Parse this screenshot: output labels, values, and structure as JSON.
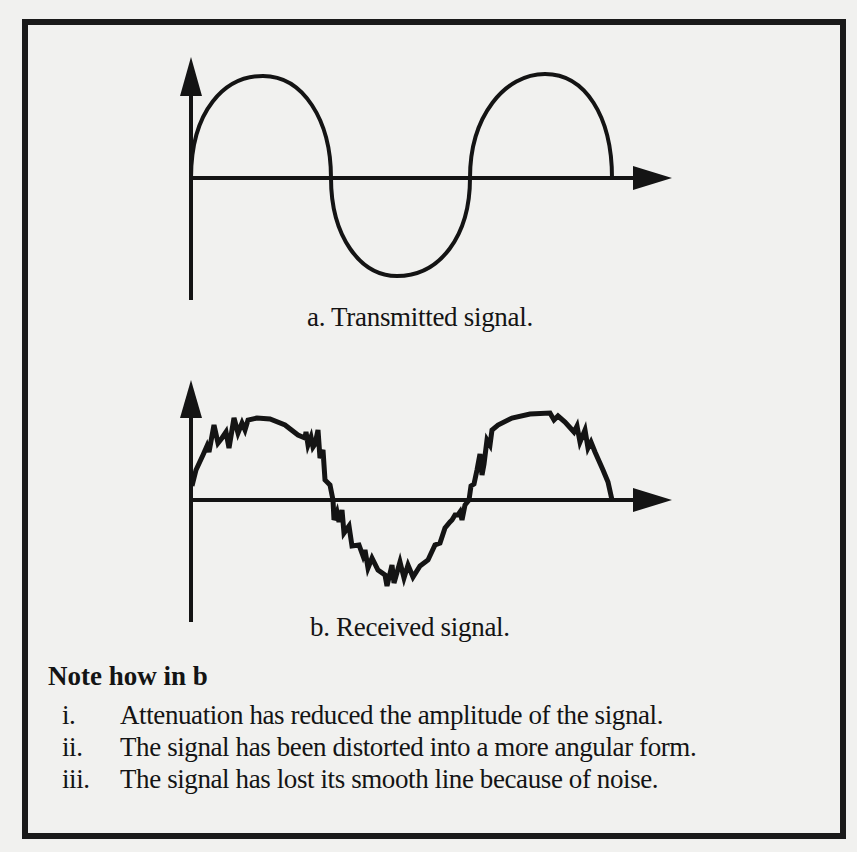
{
  "figure": {
    "caption_a": "a. Transmitted signal.",
    "caption_b": "b. Received signal."
  },
  "note": {
    "title": "Note how  in b",
    "items": [
      {
        "num": "i.",
        "text": "Attenuation has reduced the amplitude of the signal."
      },
      {
        "num": "ii.",
        "text": "The signal has been distorted into a more angular form."
      },
      {
        "num": "iii.",
        "text": "The signal has lost its smooth line because of noise."
      }
    ]
  },
  "colors": {
    "ink": "#141414",
    "paper": "#f1f1ef"
  }
}
